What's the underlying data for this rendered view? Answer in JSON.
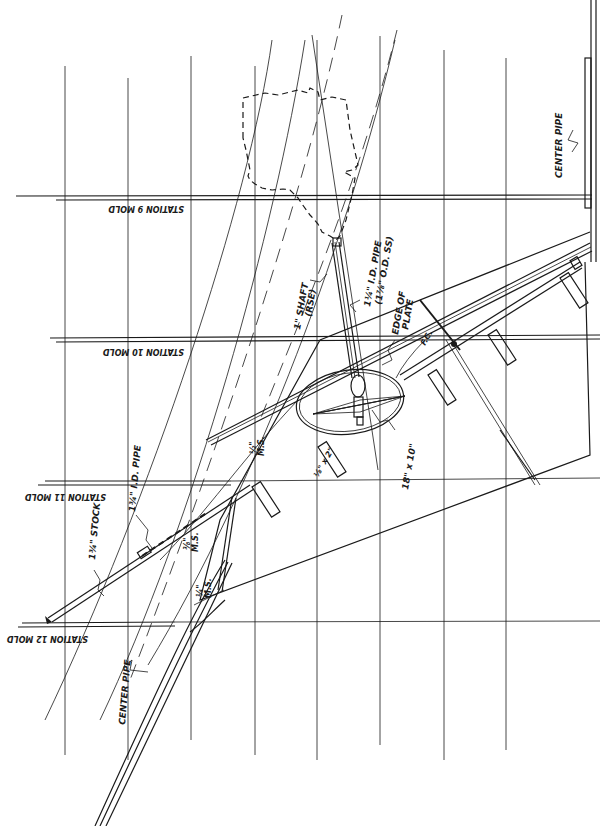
{
  "drawing": {
    "title": "Rudder / shaft layout — stations 9 to 12",
    "stations": [
      {
        "id": "station-9",
        "label": "STATION 9 MOLD",
        "y": 196
      },
      {
        "id": "station-10",
        "label": "STATION 10 MOLD",
        "y": 340
      },
      {
        "id": "station-11",
        "label": "STATION 11 MOLD",
        "y": 483
      },
      {
        "id": "station-12",
        "label": "STATION 12 MOLD",
        "y": 623
      }
    ],
    "labels": {
      "center_pipe_top": "CENTER PIPE",
      "center_pipe_bottom": "CENTER PIPE",
      "shaft": "1\" SHAFT",
      "shaft_sub": "(RSE)",
      "pipe_id": "1¼\" I.D. PIPE",
      "pipe_od": "(1⅞\" O.D. SS)",
      "edge_of_plate_1": "EDGE OF",
      "edge_of_plate_2": "PLATE",
      "fc": "F.C.",
      "ellipse_dim": "18\" x 10\"",
      "pipe_left": "1¾\" I.D. PIPE",
      "stock": "1¾\" STOCK",
      "ms_half": "½\"",
      "ms_half_sub": "M.S.",
      "ms_quarter": "¼\"",
      "ms_quarter_sub": "M.S.",
      "ms_sixteenth": "⅜\"",
      "ms_sixteenth_sub": "M.S.",
      "ms_bar": "⅛\" x 2\""
    },
    "colors": {
      "ink": "#1a1a1a",
      "paper": "#ffffff"
    }
  }
}
